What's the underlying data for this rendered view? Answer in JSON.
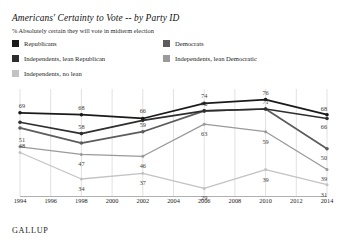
{
  "header": {
    "title": "Americans' Certainty to Vote -- by Party ID",
    "subtitle": "% Absolutely certain they will vote in midterm election"
  },
  "footer": {
    "brand": "GALLUP"
  },
  "colors": {
    "republicans": "#1a1a1a",
    "democrats": "#5c5c5c",
    "independents_lean_republican": "#2e2e2e",
    "independents_lean_democratic": "#9a9a9a",
    "independents_no_lean": "#c3c3c3",
    "gridline": "#d9d9d9",
    "axisline": "#b0b0b0",
    "background": "#ffffff",
    "label_text": "#3a3a3a"
  },
  "legend": {
    "entries": [
      {
        "label": "Republicans",
        "color": "#1a1a1a",
        "swatch": "legend-swatch-republicans"
      },
      {
        "label": "Democrats",
        "color": "#5c5c5c",
        "swatch": "legend-swatch-democrats"
      },
      {
        "label": "Independents, lean Republican",
        "color": "#2e2e2e",
        "swatch": "legend-swatch-ind-lean-rep"
      },
      {
        "label": "Independents, lean Democratic",
        "color": "#9a9a9a",
        "swatch": "legend-swatch-ind-lean-dem"
      },
      {
        "label": "Independents, no lean",
        "color": "#c3c3c3",
        "swatch": "legend-swatch-ind-no-lean"
      }
    ]
  },
  "chart_data": {
    "type": "line",
    "title": "Americans' Certainty to Vote -- by Party ID",
    "subtitle": "% Absolutely certain they will vote in midterm election",
    "xlabel": "",
    "ylabel": "",
    "ylim": [
      25,
      80
    ],
    "grid": true,
    "legend_position": "top",
    "axis_ticks": [
      "1994",
      "1996",
      "1998",
      "2000",
      "2002",
      "2004",
      "2006",
      "2008",
      "2010",
      "2012",
      "2014"
    ],
    "x": [
      1994,
      1998,
      2002,
      2006,
      2010,
      2014
    ],
    "series": [
      {
        "name": "Republicans",
        "color": "#1a1a1a",
        "values": [
          69,
          68,
          66,
          74,
          76,
          68
        ],
        "labels": [
          "69",
          "68",
          "66",
          "74",
          "76",
          "68"
        ]
      },
      {
        "name": "Independents, lean Republican",
        "color": "#2e2e2e",
        "values": [
          64,
          58,
          65,
          70,
          71,
          66
        ],
        "labels": [
          "",
          "58",
          "",
          "",
          "71",
          "66"
        ]
      },
      {
        "name": "Democrats",
        "color": "#5c5c5c",
        "values": [
          61,
          53,
          59,
          70,
          71,
          50
        ],
        "labels": [
          "",
          "",
          "59",
          "70",
          "",
          "50"
        ]
      },
      {
        "name": "Independents, lean Democratic",
        "color": "#9a9a9a",
        "values": [
          51,
          47,
          46,
          63,
          59,
          39
        ],
        "labels": [
          "51",
          "47",
          "46",
          "63",
          "59",
          "39"
        ]
      },
      {
        "name": "Independents, no lean",
        "color": "#c3c3c3",
        "values": [
          48,
          34,
          37,
          29,
          39,
          31
        ],
        "labels": [
          "48",
          "34",
          "37",
          "29",
          "39",
          "31"
        ]
      }
    ],
    "point_labels": [
      {
        "text": "69",
        "year": 1994,
        "value": 69,
        "series": "Republicans"
      },
      {
        "text": "68",
        "year": 1998,
        "value": 68,
        "series": "Republicans"
      },
      {
        "text": "66",
        "year": 2002,
        "value": 66,
        "series": "Republicans"
      },
      {
        "text": "74",
        "year": 2006,
        "value": 74,
        "series": "Republicans"
      },
      {
        "text": "76",
        "year": 2010,
        "value": 76,
        "series": "Republicans"
      },
      {
        "text": "68",
        "year": 2014,
        "value": 68,
        "series": "Republicans"
      },
      {
        "text": "58",
        "year": 1998,
        "value": 58,
        "series": "Independents, lean Republican"
      },
      {
        "text": "71",
        "year": 2010,
        "value": 71,
        "series": "Independents, lean Republican"
      },
      {
        "text": "66",
        "year": 2014,
        "value": 66,
        "series": "Independents, lean Republican"
      },
      {
        "text": "59",
        "year": 2002,
        "value": 59,
        "series": "Democrats"
      },
      {
        "text": "70",
        "year": 2006,
        "value": 70,
        "series": "Democrats"
      },
      {
        "text": "50",
        "year": 2014,
        "value": 50,
        "series": "Democrats"
      },
      {
        "text": "51",
        "year": 1994,
        "value": 51,
        "series": "Independents, lean Democratic"
      },
      {
        "text": "47",
        "year": 1998,
        "value": 47,
        "series": "Independents, lean Democratic"
      },
      {
        "text": "46",
        "year": 2002,
        "value": 46,
        "series": "Independents, lean Democratic"
      },
      {
        "text": "63",
        "year": 2006,
        "value": 63,
        "series": "Independents, lean Democratic"
      },
      {
        "text": "59",
        "year": 2010,
        "value": 59,
        "series": "Independents, lean Democratic"
      },
      {
        "text": "39",
        "year": 2014,
        "value": 39,
        "series": "Independents, lean Democratic"
      },
      {
        "text": "48",
        "year": 1994,
        "value": 48,
        "series": "Independents, no lean"
      },
      {
        "text": "34",
        "year": 1998,
        "value": 34,
        "series": "Independents, no lean"
      },
      {
        "text": "37",
        "year": 2002,
        "value": 37,
        "series": "Independents, no lean"
      },
      {
        "text": "29",
        "year": 2006,
        "value": 29,
        "series": "Independents, no lean"
      },
      {
        "text": "39",
        "year": 2010,
        "value": 39,
        "series": "Independents, no lean"
      },
      {
        "text": "31",
        "year": 2014,
        "value": 31,
        "series": "Independents, no lean"
      }
    ]
  }
}
